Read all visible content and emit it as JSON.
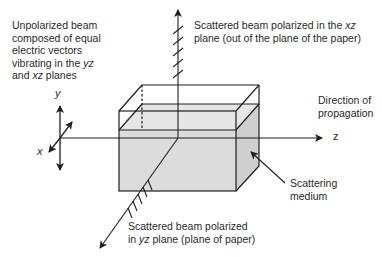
{
  "labels": {
    "unpolarized": {
      "line1": "Unpolarized beam",
      "line2": "composed of equal",
      "line3": "electric vectors",
      "line4_pre": "vibrating in the ",
      "line4_em": "yz",
      "line5_pre": "and ",
      "line5_em": "xz",
      "line5_post": " planes"
    },
    "scattered_xz": {
      "line1_pre": "Scattered beam polarized in the ",
      "line1_em": "xz",
      "line2": "plane (out of the plane of the paper)"
    },
    "direction": {
      "line1": "Direction of",
      "line2": "propagation"
    },
    "medium": {
      "line1": "Scattering",
      "line2": "medium"
    },
    "scattered_yz": {
      "line1": "Scattered beam polarized",
      "line2_pre": "in ",
      "line2_em": "yz",
      "line2_post": " plane (plane of paper)"
    }
  },
  "axes": {
    "x": "x",
    "y": "y",
    "z": "z"
  },
  "colors": {
    "line": "#1e1e1e",
    "medium_fill": "#dcdcdc",
    "medium_side": "#d2d2d2",
    "text": "#2a2a2a"
  }
}
